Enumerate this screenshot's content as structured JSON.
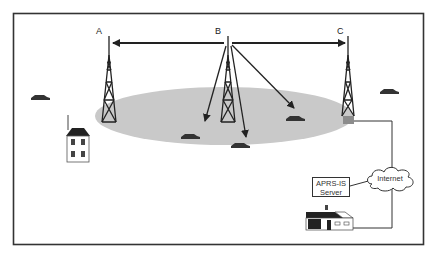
{
  "diagram": {
    "towers": [
      {
        "id": "A",
        "label": "A",
        "x": 109
      },
      {
        "id": "B",
        "label": "B",
        "x": 228
      },
      {
        "id": "C",
        "label": "C",
        "x": 348
      }
    ],
    "server": {
      "line1": "APRS-IS",
      "line2": "Server"
    },
    "cloud": {
      "label": "Internet"
    },
    "coverage_area_color": "#c8c8c8",
    "frame_color": "#333333",
    "tower_color": "#222222",
    "igate_box_color": "#8c8c8c"
  }
}
